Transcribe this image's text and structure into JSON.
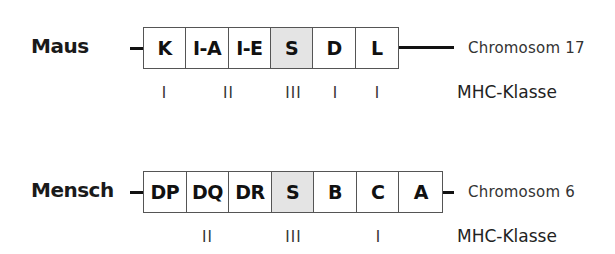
{
  "mouse": {
    "label": "Maus",
    "chromosome": "Chromosom  17",
    "genes": [
      "K",
      "I-A",
      "I-E",
      "S",
      "D",
      "L"
    ],
    "shaded_index": 3,
    "classes": [
      {
        "label": "I",
        "under_gene_index": 0
      },
      {
        "label": "II",
        "under_gene_index": 1.5
      },
      {
        "label": "III",
        "under_gene_index": 3
      },
      {
        "label": "I",
        "under_gene_index": 4
      },
      {
        "label": "I",
        "under_gene_index": 5
      }
    ],
    "class_axis_label": "MHC-Klasse"
  },
  "human": {
    "label": "Mensch",
    "chromosome": "Chromosom  6",
    "genes": [
      "DP",
      "DQ",
      "DR",
      "S",
      "B",
      "C",
      "A"
    ],
    "shaded_index": 3,
    "classes": [
      {
        "label": "II",
        "under_gene_index": 1
      },
      {
        "label": "III",
        "under_gene_index": 3
      },
      {
        "label": "I",
        "under_gene_index": 5
      }
    ],
    "class_axis_label": "MHC-Klasse"
  },
  "colors": {
    "shaded_region": "#e4e4e4",
    "box_border": "#555555",
    "text": "#111111"
  }
}
